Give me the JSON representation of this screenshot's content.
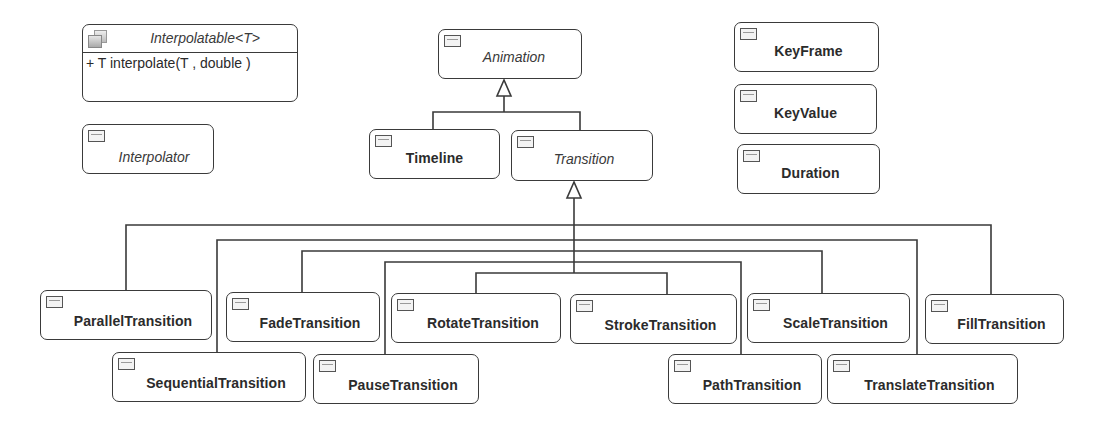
{
  "diagram": {
    "type": "UML class diagram",
    "classes": [
      {
        "id": "interpolatable",
        "name": "Interpolatable<T>",
        "kind": "interface",
        "style": "italic",
        "members": [
          "+ T interpolate(T , double )"
        ],
        "box": [
          82,
          24,
          216,
          78
        ]
      },
      {
        "id": "interpolator",
        "name": "Interpolator",
        "kind": "abstract",
        "style": "italic",
        "box": [
          82,
          124,
          132,
          50
        ]
      },
      {
        "id": "animation",
        "name": "Animation",
        "kind": "abstract",
        "style": "italic",
        "box": [
          438,
          29,
          144,
          50
        ]
      },
      {
        "id": "timeline",
        "name": "Timeline",
        "kind": "class",
        "style": "bold",
        "box": [
          369,
          129,
          131,
          50
        ]
      },
      {
        "id": "transition",
        "name": "Transition",
        "kind": "abstract",
        "style": "italic",
        "box": [
          511,
          130,
          142,
          51
        ]
      },
      {
        "id": "keyframe",
        "name": "KeyFrame",
        "kind": "class",
        "style": "bold",
        "box": [
          734,
          22,
          145,
          50
        ]
      },
      {
        "id": "keyvalue",
        "name": "KeyValue",
        "kind": "class",
        "style": "bold",
        "box": [
          734,
          84,
          143,
          50
        ]
      },
      {
        "id": "duration",
        "name": "Duration",
        "kind": "class",
        "style": "bold",
        "box": [
          737,
          144,
          143,
          50
        ]
      },
      {
        "id": "parallel",
        "name": "ParallelTransition",
        "kind": "class",
        "style": "bold",
        "box": [
          40,
          290,
          172,
          50
        ]
      },
      {
        "id": "sequential",
        "name": "SequentialTransition",
        "kind": "class",
        "style": "bold",
        "box": [
          112,
          352,
          194,
          50
        ]
      },
      {
        "id": "fade",
        "name": "FadeTransition",
        "kind": "class",
        "style": "bold",
        "box": [
          226,
          292,
          154,
          50
        ]
      },
      {
        "id": "pause",
        "name": "PauseTransition",
        "kind": "class",
        "style": "bold",
        "box": [
          313,
          354,
          166,
          50
        ]
      },
      {
        "id": "rotate",
        "name": "RotateTransition",
        "kind": "class",
        "style": "bold",
        "box": [
          391,
          293,
          170,
          50
        ]
      },
      {
        "id": "stroke",
        "name": "StrokeTransition",
        "kind": "class",
        "style": "bold",
        "box": [
          570,
          294,
          167,
          50
        ]
      },
      {
        "id": "path",
        "name": "PathTransition",
        "kind": "class",
        "style": "bold",
        "box": [
          668,
          354,
          154,
          50
        ]
      },
      {
        "id": "scale",
        "name": "ScaleTransition",
        "kind": "class",
        "style": "bold",
        "box": [
          747,
          293,
          163,
          50
        ]
      },
      {
        "id": "translate",
        "name": "TranslateTransition",
        "kind": "class",
        "style": "bold",
        "box": [
          827,
          354,
          191,
          50
        ]
      },
      {
        "id": "fill",
        "name": "FillTransition",
        "kind": "class",
        "style": "bold",
        "box": [
          925,
          294,
          139,
          50
        ]
      }
    ],
    "generalizations": [
      {
        "child": "timeline",
        "parent": "animation"
      },
      {
        "child": "transition",
        "parent": "animation"
      },
      {
        "child": "parallel",
        "parent": "transition"
      },
      {
        "child": "sequential",
        "parent": "transition"
      },
      {
        "child": "fade",
        "parent": "transition"
      },
      {
        "child": "pause",
        "parent": "transition"
      },
      {
        "child": "rotate",
        "parent": "transition"
      },
      {
        "child": "stroke",
        "parent": "transition"
      },
      {
        "child": "path",
        "parent": "transition"
      },
      {
        "child": "scale",
        "parent": "transition"
      },
      {
        "child": "translate",
        "parent": "transition"
      },
      {
        "child": "fill",
        "parent": "transition"
      }
    ]
  },
  "labels": {
    "interpolatable": "Interpolatable<T>",
    "interpolatable_member": "+ T interpolate(T , double )",
    "interpolator": "Interpolator",
    "animation": "Animation",
    "timeline": "Timeline",
    "transition": "Transition",
    "keyframe": "KeyFrame",
    "keyvalue": "KeyValue",
    "duration": "Duration",
    "parallel": "ParallelTransition",
    "sequential": "SequentialTransition",
    "fade": "FadeTransition",
    "pause": "PauseTransition",
    "rotate": "RotateTransition",
    "stroke": "StrokeTransition",
    "path": "PathTransition",
    "scale": "ScaleTransition",
    "translate": "TranslateTransition",
    "fill": "FillTransition"
  },
  "colors": {
    "line": "#3a3a3a",
    "box_border": "#3a3a3a",
    "background": "#ffffff",
    "text": "#2a2a2a"
  }
}
